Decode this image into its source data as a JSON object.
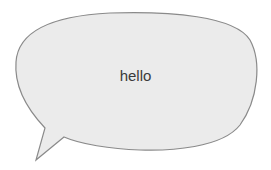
{
  "speech_bubble": {
    "text": "hello",
    "fill_color": "#ebebeb",
    "stroke_color": "#8a8a8a",
    "text_color": "#3a3a3a",
    "tail_direction": "bottom-left"
  }
}
